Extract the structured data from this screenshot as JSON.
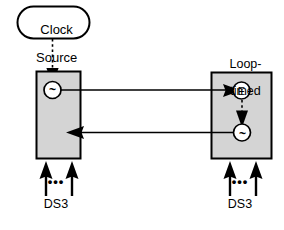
{
  "diagram": {
    "colors": {
      "box_fill": "#d4d4d4",
      "box_stroke": "#000000",
      "line": "#000000",
      "background": "#ffffff"
    },
    "clock_source": {
      "label": "Clock\nSource",
      "line1": "Clock",
      "line2": "Source",
      "shape": "stadium"
    },
    "left_node": {
      "name": "master-node",
      "oscillator_symbol": "~",
      "oscillator_meaning": "oscillator"
    },
    "right_node": {
      "name": "loop-timed-node",
      "label": "Loop-\ntimed",
      "label_line1": "Loop-",
      "label_line2": "timed",
      "extractor_symbol": "E",
      "extractor_meaning": "clock-extractor",
      "oscillator_symbol": "~",
      "oscillator_meaning": "oscillator"
    },
    "tributaries": {
      "left": {
        "label": "DS3",
        "ellipsis": "•••",
        "arrow_count": 2
      },
      "right": {
        "label": "DS3",
        "ellipsis": "•••",
        "arrow_count": 2
      }
    },
    "links": [
      {
        "name": "forward-link",
        "from": "left_node",
        "to": "right_node",
        "direction": "left-to-right"
      },
      {
        "name": "return-link",
        "from": "right_node",
        "to": "left_node",
        "direction": "right-to-left"
      }
    ],
    "dashed_links": [
      {
        "name": "clock-source-feed",
        "from": "clock_source",
        "to": "left_node_oscillator"
      },
      {
        "name": "extracted-clock-feed",
        "from": "right_node_extractor",
        "to": "right_node_oscillator"
      }
    ]
  }
}
